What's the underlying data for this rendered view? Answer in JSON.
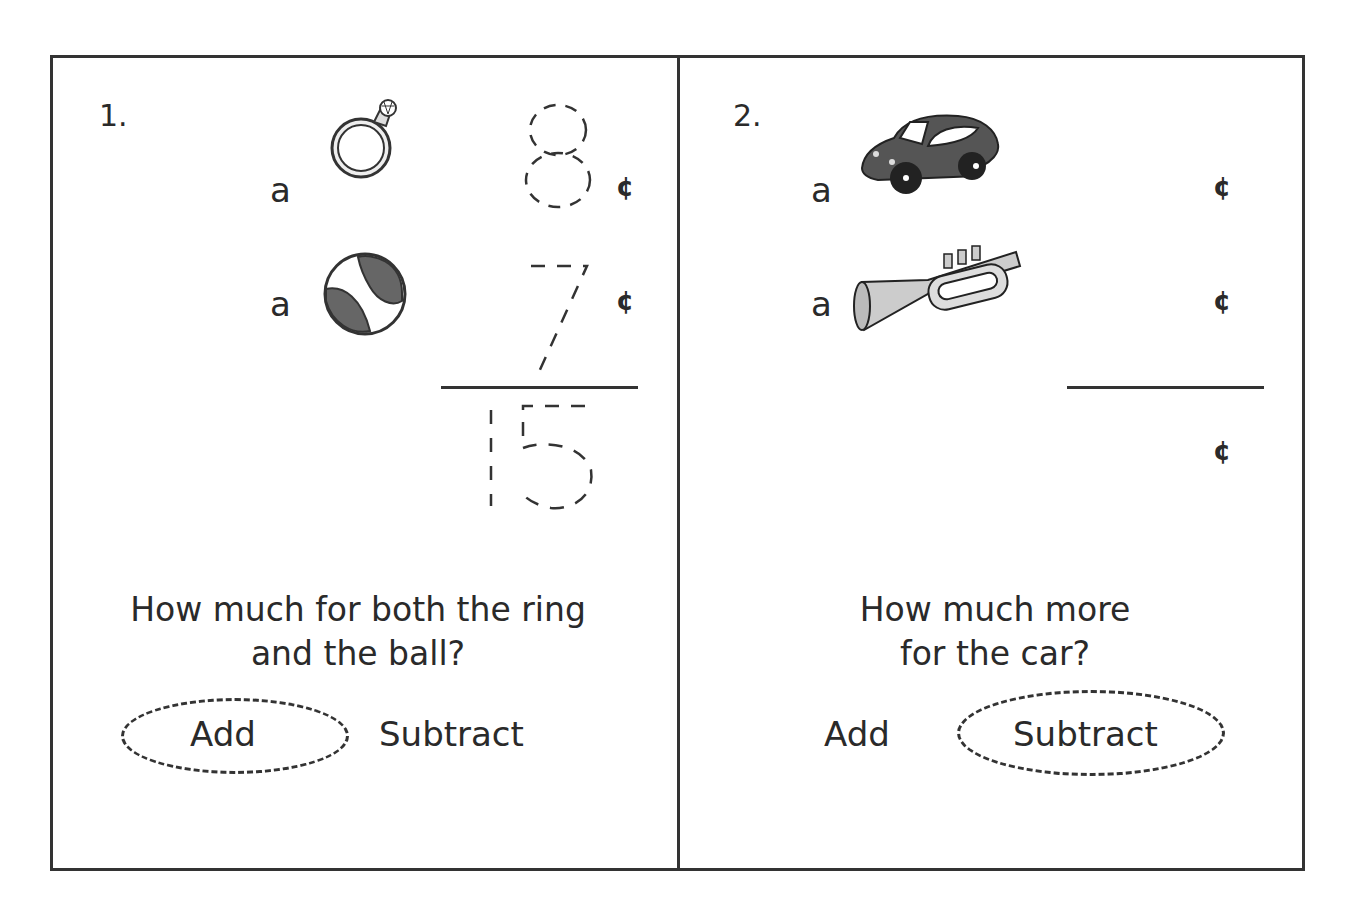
{
  "worksheet": {
    "problems": [
      {
        "number": "1.",
        "items": [
          {
            "article": "a",
            "item": "ring",
            "icon": "ring-icon",
            "price": "8",
            "unit": "¢"
          },
          {
            "article": "a",
            "item": "ball",
            "icon": "ball-icon",
            "price": "7",
            "unit": "¢"
          }
        ],
        "answer": "15",
        "answer_unit": "",
        "question_line1": "How much for both the ring",
        "question_line2": "and the ball?",
        "choices": [
          "Add",
          "Subtract"
        ],
        "selected_choice": "Add"
      },
      {
        "number": "2.",
        "items": [
          {
            "article": "a",
            "item": "car",
            "icon": "car-icon",
            "price": "",
            "unit": "¢"
          },
          {
            "article": "a",
            "item": "trumpet",
            "icon": "trumpet-icon",
            "price": "",
            "unit": "¢"
          }
        ],
        "answer": "",
        "answer_unit": "¢",
        "question_line1": "How much more",
        "question_line2": "for the car?",
        "choices": [
          "Add",
          "Subtract"
        ],
        "selected_choice": "Subtract"
      }
    ],
    "colors": {
      "ink": "#333333",
      "fill_gray": "#666666",
      "light_gray": "#cccccc"
    }
  }
}
